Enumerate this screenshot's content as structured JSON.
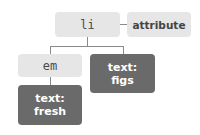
{
  "diagram": {
    "nodes": {
      "li": {
        "label": "li"
      },
      "attribute": {
        "label": "attribute"
      },
      "em": {
        "label": "em"
      },
      "text_figs": {
        "line1": "text:",
        "line2": "figs"
      },
      "text_fresh": {
        "line1": "text:",
        "line2": "fresh"
      }
    },
    "colors": {
      "element_fill": "#e6e6e6",
      "text_fill": "#6a6a6a",
      "connector": "#8a8a8a"
    }
  }
}
